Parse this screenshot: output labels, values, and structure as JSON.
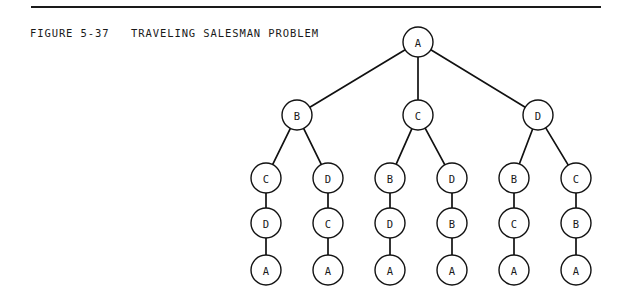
{
  "figure": {
    "caption": "FIGURE 5-37   TRAVELING SALESMAN PROBLEM",
    "caption_number": "5-37",
    "caption_title": "TRAVELING SALESMAN PROBLEM",
    "rule_color": "#1a1a1a",
    "ink_color": "#111111",
    "background_color": "#ffffff"
  },
  "chart_data": {
    "type": "tree-diagram",
    "title": "TRAVELING SALESMAN PROBLEM",
    "node_radius": 15,
    "levels": [
      {
        "index": 0,
        "y": 42,
        "labels": [
          "A"
        ]
      },
      {
        "index": 1,
        "y": 115,
        "labels": [
          "B",
          "C",
          "D"
        ]
      },
      {
        "index": 2,
        "y": 178,
        "labels": [
          "C",
          "D",
          "B",
          "D",
          "B",
          "C"
        ]
      },
      {
        "index": 3,
        "y": 223,
        "labels": [
          "D",
          "C",
          "D",
          "B",
          "C",
          "B"
        ]
      },
      {
        "index": 4,
        "y": 270,
        "labels": [
          "A",
          "A",
          "A",
          "A",
          "A",
          "A"
        ]
      }
    ],
    "nodes": [
      {
        "id": "n0",
        "label": "A",
        "x": 418,
        "y": 42,
        "level": 0
      },
      {
        "id": "n1-0",
        "label": "B",
        "x": 297,
        "y": 115,
        "level": 1
      },
      {
        "id": "n1-1",
        "label": "C",
        "x": 418,
        "y": 115,
        "level": 1
      },
      {
        "id": "n1-2",
        "label": "D",
        "x": 538,
        "y": 115,
        "level": 1
      },
      {
        "id": "n2-0",
        "label": "C",
        "x": 266,
        "y": 178,
        "level": 2
      },
      {
        "id": "n2-1",
        "label": "D",
        "x": 328,
        "y": 178,
        "level": 2
      },
      {
        "id": "n2-2",
        "label": "B",
        "x": 390,
        "y": 178,
        "level": 2
      },
      {
        "id": "n2-3",
        "label": "D",
        "x": 452,
        "y": 178,
        "level": 2
      },
      {
        "id": "n2-4",
        "label": "B",
        "x": 514,
        "y": 178,
        "level": 2
      },
      {
        "id": "n2-5",
        "label": "C",
        "x": 576,
        "y": 178,
        "level": 2
      },
      {
        "id": "n3-0",
        "label": "D",
        "x": 266,
        "y": 223,
        "level": 3
      },
      {
        "id": "n3-1",
        "label": "C",
        "x": 328,
        "y": 223,
        "level": 3
      },
      {
        "id": "n3-2",
        "label": "D",
        "x": 390,
        "y": 223,
        "level": 3
      },
      {
        "id": "n3-3",
        "label": "B",
        "x": 452,
        "y": 223,
        "level": 3
      },
      {
        "id": "n3-4",
        "label": "C",
        "x": 514,
        "y": 223,
        "level": 3
      },
      {
        "id": "n3-5",
        "label": "B",
        "x": 576,
        "y": 223,
        "level": 3
      },
      {
        "id": "n4-0",
        "label": "A",
        "x": 266,
        "y": 270,
        "level": 4
      },
      {
        "id": "n4-1",
        "label": "A",
        "x": 328,
        "y": 270,
        "level": 4
      },
      {
        "id": "n4-2",
        "label": "A",
        "x": 390,
        "y": 270,
        "level": 4
      },
      {
        "id": "n4-3",
        "label": "A",
        "x": 452,
        "y": 270,
        "level": 4
      },
      {
        "id": "n4-4",
        "label": "A",
        "x": 514,
        "y": 270,
        "level": 4
      },
      {
        "id": "n4-5",
        "label": "A",
        "x": 576,
        "y": 270,
        "level": 4
      }
    ],
    "edges": [
      {
        "from": "n0",
        "to": "n1-0"
      },
      {
        "from": "n0",
        "to": "n1-1"
      },
      {
        "from": "n0",
        "to": "n1-2"
      },
      {
        "from": "n1-0",
        "to": "n2-0"
      },
      {
        "from": "n1-0",
        "to": "n2-1"
      },
      {
        "from": "n1-1",
        "to": "n2-2"
      },
      {
        "from": "n1-1",
        "to": "n2-3"
      },
      {
        "from": "n1-2",
        "to": "n2-4"
      },
      {
        "from": "n1-2",
        "to": "n2-5"
      },
      {
        "from": "n2-0",
        "to": "n3-0"
      },
      {
        "from": "n2-1",
        "to": "n3-1"
      },
      {
        "from": "n2-2",
        "to": "n3-2"
      },
      {
        "from": "n2-3",
        "to": "n3-3"
      },
      {
        "from": "n2-4",
        "to": "n3-4"
      },
      {
        "from": "n2-5",
        "to": "n3-5"
      },
      {
        "from": "n3-0",
        "to": "n4-0"
      },
      {
        "from": "n3-1",
        "to": "n4-1"
      },
      {
        "from": "n3-2",
        "to": "n4-2"
      },
      {
        "from": "n3-3",
        "to": "n4-3"
      },
      {
        "from": "n3-4",
        "to": "n4-4"
      },
      {
        "from": "n3-5",
        "to": "n4-5"
      }
    ],
    "tours": [
      [
        "A",
        "B",
        "C",
        "D",
        "A"
      ],
      [
        "A",
        "B",
        "D",
        "C",
        "A"
      ],
      [
        "A",
        "C",
        "B",
        "D",
        "A"
      ],
      [
        "A",
        "C",
        "D",
        "B",
        "A"
      ],
      [
        "A",
        "D",
        "B",
        "C",
        "A"
      ],
      [
        "A",
        "D",
        "C",
        "B",
        "A"
      ]
    ]
  }
}
